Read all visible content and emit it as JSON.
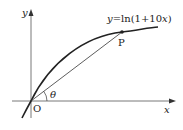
{
  "diagram": {
    "curve_label": "y=ln(1+10x)",
    "curve_label_prefix": "y",
    "curve_label_rest": "=ln(1+10",
    "curve_label_var": "x",
    "curve_label_close": ")",
    "point_label": "P",
    "origin_label": "O",
    "angle_label": "θ",
    "x_axis_label": "x",
    "y_axis_label": "y",
    "colors": {
      "line": "#222222",
      "background": "#ffffff"
    }
  }
}
